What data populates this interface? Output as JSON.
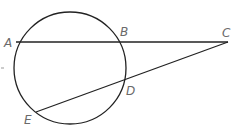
{
  "diagram": {
    "circle": {
      "cx": 70,
      "cy": 68,
      "r": 56
    },
    "points": {
      "A": {
        "x": 16,
        "y": 42,
        "label": "A",
        "lx": 4,
        "ly": 47
      },
      "B": {
        "x": 124,
        "y": 42,
        "label": "B",
        "lx": 120,
        "ly": 36
      },
      "C": {
        "x": 228,
        "y": 42,
        "label": "C",
        "lx": 222,
        "ly": 37
      },
      "D": {
        "x": 124,
        "y": 80,
        "label": "D",
        "lx": 126,
        "ly": 95
      },
      "E": {
        "x": 36,
        "y": 112,
        "label": "E",
        "lx": 24,
        "ly": 124
      }
    },
    "segments": [
      [
        "A",
        "C"
      ],
      [
        "E",
        "C"
      ]
    ],
    "stroke_color": "#222222",
    "label_color": "#6a6a6a"
  }
}
